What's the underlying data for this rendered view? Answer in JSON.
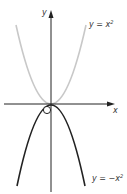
{
  "diagram": {
    "axes": {
      "x_label": "x",
      "y_label": "y"
    },
    "curves": [
      {
        "name": "upper-parabola",
        "equation_prefix": "y = x",
        "exponent": "2",
        "color": "#c8c8c8"
      },
      {
        "name": "lower-parabola",
        "equation_prefix": "y = −x",
        "exponent": "2",
        "color": "#222222"
      }
    ],
    "origin_marker": "O"
  }
}
